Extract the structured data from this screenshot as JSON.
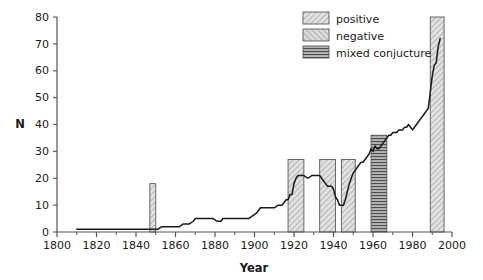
{
  "chart_data": {
    "type": "line",
    "title": "",
    "xlabel": "Year",
    "ylabel": "N",
    "xlim": [
      1800,
      2000
    ],
    "ylim": [
      0,
      80
    ],
    "grid": false,
    "legend_position": "top-right",
    "xticks": [
      1800,
      1820,
      1840,
      1860,
      1880,
      1900,
      1920,
      1940,
      1960,
      1980,
      2000
    ],
    "xtick_labels": [
      "1800",
      "1820",
      "1840",
      "1860",
      "1880",
      "1900",
      "1920",
      "1940",
      "1960",
      "1980",
      "2000"
    ],
    "xtick_minor_step": 10,
    "yticks": [
      0,
      10,
      20,
      30,
      40,
      50,
      60,
      70,
      80
    ],
    "ytick_labels": [
      "0",
      "10",
      "20",
      "30",
      "40",
      "50",
      "60",
      "70",
      "80"
    ],
    "legend": [
      {
        "label": "positive",
        "pattern": "diagonal-hatch-right",
        "fill": "#d9d9d9"
      },
      {
        "label": "negative",
        "pattern": "diagonal-hatch-left",
        "fill": "#d0d0d0"
      },
      {
        "label": "mixed conjucture",
        "pattern": "horizontal-hatch",
        "fill": "#9a9a9a"
      }
    ],
    "shaded_bands": [
      {
        "name": "band-1847-1850",
        "category": "positive",
        "x_start": 1847,
        "x_end": 1850,
        "top": 18
      },
      {
        "name": "band-1917-1925",
        "category": "positive",
        "x_start": 1917,
        "x_end": 1925,
        "top": 27
      },
      {
        "name": "band-1933-1941",
        "category": "positive",
        "x_start": 1933,
        "x_end": 1941,
        "top": 27
      },
      {
        "name": "band-1944-1951",
        "category": "positive",
        "x_start": 1944,
        "x_end": 1951,
        "top": 27
      },
      {
        "name": "band-1959-1967",
        "category": "mixed conjucture",
        "x_start": 1959,
        "x_end": 1967,
        "top": 36
      },
      {
        "name": "band-1989-1996",
        "category": "positive",
        "x_start": 1989,
        "x_end": 1996,
        "top": 80
      }
    ],
    "series": [
      {
        "name": "N",
        "color": "#1a1a1a",
        "x": [
          1810,
          1815,
          1820,
          1825,
          1830,
          1835,
          1840,
          1845,
          1847,
          1849,
          1851,
          1853,
          1855,
          1857,
          1858,
          1860,
          1862,
          1864,
          1866,
          1867,
          1869,
          1870,
          1872,
          1874,
          1876,
          1878,
          1879,
          1881,
          1883,
          1884,
          1886,
          1888,
          1890,
          1892,
          1894,
          1896,
          1897,
          1899,
          1901,
          1903,
          1905,
          1907,
          1909,
          1910,
          1912,
          1914,
          1915,
          1916,
          1917,
          1918,
          1919,
          1920,
          1921,
          1922,
          1923,
          1925,
          1927,
          1929,
          1931,
          1932,
          1933,
          1934,
          1935,
          1936,
          1937,
          1938,
          1939,
          1940,
          1941,
          1942,
          1943,
          1944,
          1945,
          1946,
          1947,
          1948,
          1949,
          1950,
          1951,
          1952,
          1953,
          1954,
          1955,
          1956,
          1957,
          1958,
          1959,
          1960,
          1961,
          1962,
          1963,
          1964,
          1965,
          1966,
          1967,
          1968,
          1969,
          1970,
          1971,
          1972,
          1973,
          1974,
          1975,
          1976,
          1977,
          1978,
          1979,
          1980,
          1981,
          1982,
          1983,
          1984,
          1985,
          1986,
          1987,
          1988,
          1989,
          1990,
          1991,
          1992,
          1993,
          1994
        ],
        "y": [
          1,
          1,
          1,
          1,
          1,
          1,
          1,
          1,
          1,
          1,
          1,
          2,
          2,
          2,
          2,
          2,
          2,
          3,
          3,
          3,
          4,
          5,
          5,
          5,
          5,
          5,
          5,
          4,
          4,
          5,
          5,
          5,
          5,
          5,
          5,
          5,
          5,
          6,
          7,
          9,
          9,
          9,
          9,
          9,
          10,
          10,
          11,
          12,
          12,
          14,
          14,
          18,
          20,
          21,
          21,
          21,
          20,
          21,
          21,
          21,
          21,
          20,
          19,
          18,
          17,
          17,
          17,
          16,
          13,
          12,
          10,
          10,
          10,
          12,
          15,
          18,
          20,
          22,
          23,
          24,
          25,
          26,
          26,
          27,
          28,
          29,
          31,
          30,
          32,
          31,
          31,
          32,
          33,
          34,
          35,
          36,
          36,
          37,
          37,
          37,
          38,
          38,
          38,
          39,
          39,
          40,
          39,
          38,
          39,
          40,
          41,
          42,
          43,
          44,
          45,
          46,
          52,
          58,
          62,
          63,
          69,
          72
        ]
      }
    ]
  },
  "axes": {
    "ylabel": "N",
    "xlabel": "Year"
  }
}
